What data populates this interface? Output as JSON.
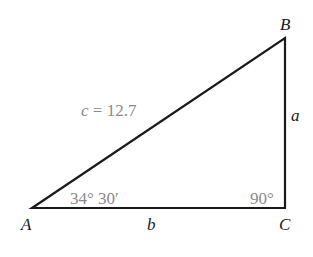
{
  "diagram": {
    "type": "right-triangle",
    "vertices": [
      {
        "id": "A",
        "label": "A",
        "x": 32,
        "y": 208
      },
      {
        "id": "B",
        "label": "B",
        "x": 285,
        "y": 38
      },
      {
        "id": "C",
        "label": "C",
        "x": 285,
        "y": 208
      }
    ],
    "sides": {
      "a": {
        "label": "a"
      },
      "b": {
        "label": "b"
      },
      "c": {
        "var": "c",
        "eq": "= 12.7"
      }
    },
    "angles": {
      "A": {
        "label": "34° 30′"
      },
      "C": {
        "label": "90°"
      }
    },
    "colors": {
      "line": "#1a1a1a",
      "annotation": "#8a8a8a"
    }
  }
}
